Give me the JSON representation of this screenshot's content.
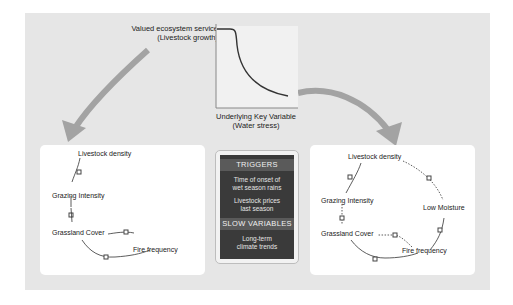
{
  "chart": {
    "ylabel_line1": "Valued ecosystem service",
    "ylabel_line2": "(Livestock growth)",
    "xlabel_line1": "Underlying Key Variable",
    "xlabel_line2": "(Water stress)"
  },
  "left_panel": {
    "nodes": [
      "Livestock density",
      "Grazing Intensity",
      "Grassland Cover",
      "Fire frequency"
    ]
  },
  "right_panel": {
    "nodes": [
      "Livestock density",
      "Grazing Intensity",
      "Low Moisture",
      "Grassland Cover",
      "Fire frequency"
    ]
  },
  "center_box": {
    "triggers_title": "TRIGGERS",
    "trigger_1_line1": "Time of onset of",
    "trigger_1_line2": "wet season rains",
    "trigger_2_line1": "Livestock prices",
    "trigger_2_line2": "last season",
    "slow_title": "SLOW VARIABLES",
    "slow_1_line1": "Long-term",
    "slow_1_line2": "climate trends"
  },
  "colors": {
    "background": "#e6e6e6",
    "panel": "#ffffff",
    "arrow": "#9a9a9a",
    "box": "#3a3a3a",
    "header": "#5a5a5a"
  }
}
